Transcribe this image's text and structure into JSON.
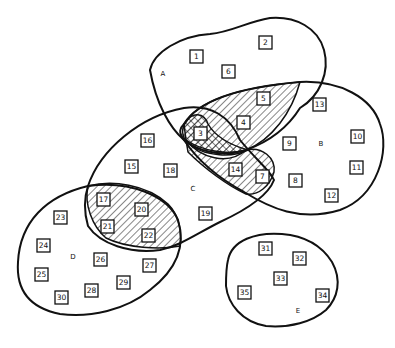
{
  "diagram": {
    "type": "venn-style set diagram",
    "sets": [
      {
        "label": "A",
        "members": [
          "1",
          "2",
          "3",
          "4",
          "5",
          "6"
        ]
      },
      {
        "label": "B",
        "members": [
          "3",
          "4",
          "5",
          "7",
          "8",
          "9",
          "10",
          "11",
          "12",
          "13",
          "14"
        ]
      },
      {
        "label": "C",
        "members": [
          "3",
          "7",
          "14",
          "15",
          "16",
          "17",
          "18",
          "19",
          "20",
          "21",
          "22"
        ]
      },
      {
        "label": "D",
        "members": [
          "17",
          "20",
          "21",
          "22",
          "23",
          "24",
          "25",
          "26",
          "27",
          "28",
          "29",
          "30"
        ]
      },
      {
        "label": "E",
        "members": [
          "31",
          "32",
          "33",
          "34",
          "35"
        ]
      }
    ],
    "shading": {
      "single_hatch": [
        "A∩B",
        "B∩C",
        "C∩D"
      ],
      "cross_hatch": [
        "A∩B∩C"
      ]
    },
    "items": [
      {
        "n": "1"
      },
      {
        "n": "2"
      },
      {
        "n": "3"
      },
      {
        "n": "4"
      },
      {
        "n": "5"
      },
      {
        "n": "6"
      },
      {
        "n": "7"
      },
      {
        "n": "8"
      },
      {
        "n": "9"
      },
      {
        "n": "10"
      },
      {
        "n": "11"
      },
      {
        "n": "12"
      },
      {
        "n": "13"
      },
      {
        "n": "14"
      },
      {
        "n": "15"
      },
      {
        "n": "16"
      },
      {
        "n": "17"
      },
      {
        "n": "18"
      },
      {
        "n": "19"
      },
      {
        "n": "20"
      },
      {
        "n": "21"
      },
      {
        "n": "22"
      },
      {
        "n": "23"
      },
      {
        "n": "24"
      },
      {
        "n": "25"
      },
      {
        "n": "26"
      },
      {
        "n": "27"
      },
      {
        "n": "28"
      },
      {
        "n": "29"
      },
      {
        "n": "30"
      },
      {
        "n": "31"
      },
      {
        "n": "32"
      },
      {
        "n": "33"
      },
      {
        "n": "34"
      },
      {
        "n": "35"
      }
    ],
    "labels": {
      "a": "A",
      "b": "B",
      "c": "C",
      "d": "D",
      "e": "E"
    }
  }
}
